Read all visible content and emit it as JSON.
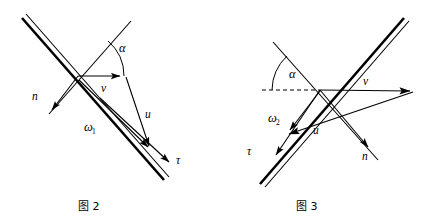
{
  "document": {
    "title": "图 2 与 图 3 矢量图",
    "background_color": "#ffffff",
    "ink_color": "#000000"
  },
  "figures": [
    {
      "id": "fig2",
      "caption": "图 2",
      "origin": [
        78,
        76
      ],
      "labels": {
        "alpha": "α",
        "v": "v",
        "u": "u",
        "n": "n",
        "omega": "ω",
        "omega_sub": "1",
        "tau": "τ"
      },
      "vectors": [
        {
          "name": "v",
          "from": [
            78,
            76
          ],
          "to": [
            124,
            76
          ],
          "head": true
        },
        {
          "name": "u",
          "from": [
            126,
            78
          ],
          "to": [
            152,
            152
          ],
          "head": true
        },
        {
          "name": "omega1",
          "from": [
            78,
            79
          ],
          "to": [
            152,
            152
          ],
          "head": true
        },
        {
          "name": "n",
          "from": [
            78,
            76
          ],
          "to": [
            49,
            114
          ],
          "head": true
        },
        {
          "name": "tau",
          "from": [
            78,
            76
          ],
          "to": [
            172,
            166
          ],
          "head": true
        }
      ],
      "lines": [
        {
          "name": "surface-line",
          "from": [
            22,
            18
          ],
          "to": [
            164,
            180
          ]
        },
        {
          "name": "incident-line",
          "from": [
            130,
            22
          ],
          "to": [
            46,
            118
          ]
        }
      ],
      "arc": {
        "name": "alpha-arc",
        "center": [
          78,
          76
        ],
        "radius": 46,
        "from_deg": 0,
        "to_deg": 49
      }
    },
    {
      "id": "fig3",
      "caption": "图 3",
      "origin": [
        320,
        90
      ],
      "labels": {
        "alpha": "α",
        "v": "v",
        "u": "u",
        "n": "n",
        "omega": "ω",
        "omega_sub": "2",
        "tau": "τ"
      },
      "vectors": [
        {
          "name": "v",
          "from": [
            320,
            90
          ],
          "to": [
            414,
            91
          ],
          "head": true
        },
        {
          "name": "u",
          "from": [
            414,
            91
          ],
          "to": [
            284,
            135
          ],
          "head": true
        },
        {
          "name": "omega2",
          "from": [
            320,
            90
          ],
          "to": [
            284,
            133
          ],
          "head": true
        },
        {
          "name": "n",
          "from": [
            320,
            90
          ],
          "to": [
            372,
            152
          ],
          "head": true
        },
        {
          "name": "tau",
          "from": [
            320,
            90
          ],
          "to": [
            271,
            161
          ],
          "head": true
        }
      ],
      "lines": [
        {
          "name": "surface-line",
          "from": [
            404,
            18
          ],
          "to": [
            260,
            184
          ]
        },
        {
          "name": "incident-line",
          "from": [
            273,
            42
          ],
          "to": [
            378,
            160
          ]
        },
        {
          "name": "dashed-axis",
          "from": [
            262,
            90
          ],
          "to": [
            320,
            90
          ],
          "style": "dashed"
        }
      ],
      "arc": {
        "name": "alpha-arc",
        "center": [
          320,
          90
        ],
        "radius": 48,
        "from_deg": 180,
        "to_deg": 133
      }
    }
  ]
}
